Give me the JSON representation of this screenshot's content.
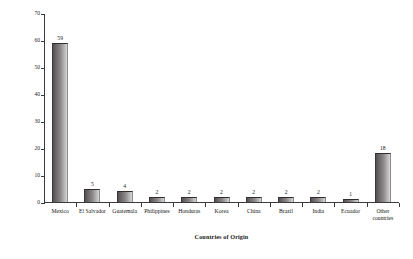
{
  "chart_data": {
    "type": "bar",
    "title": "",
    "xlabel": "Countries of Origin",
    "ylabel": "Percent of Immigrants",
    "categories": [
      "Mexico",
      "El Salvador",
      "Guatemala",
      "Philippines",
      "Honduras",
      "Korea",
      "China",
      "Brazil",
      "India",
      "Ecuador",
      "Other\ncountries"
    ],
    "values": [
      59,
      5,
      4,
      2,
      2,
      2,
      2,
      2,
      2,
      1,
      18
    ],
    "data_labels": [
      "59",
      "5",
      "4",
      "2",
      "2",
      "2",
      "2",
      "2",
      "2",
      "1",
      "18"
    ],
    "ylim": [
      0,
      70
    ],
    "yticks": [
      0,
      10,
      20,
      30,
      40,
      50,
      60,
      70
    ],
    "ytick_labels": [
      "0",
      "10",
      "20",
      "30",
      "40",
      "50",
      "60",
      "70"
    ],
    "grid": false,
    "legend": false,
    "bar_color": "#8d8a8c",
    "axis_color": "#3b3b3b",
    "background": "#ffffff"
  }
}
